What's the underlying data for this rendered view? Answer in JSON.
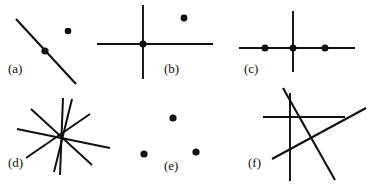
{
  "figure": {
    "width": 372,
    "height": 186,
    "background_color": "#ffffff",
    "ink_color": "#111111",
    "label_font_size": 13,
    "panels": [
      {
        "id": "a",
        "label": "(a)",
        "label_x": 8,
        "label_y": 73,
        "lines": [
          {
            "name": "diagonal-line",
            "x1": 16,
            "y1": 19,
            "x2": 76,
            "y2": 84,
            "width": 2.1
          }
        ],
        "dots": [
          {
            "name": "dot-on-line",
            "cx": 45,
            "cy": 51,
            "r": 3.6
          },
          {
            "name": "dot-off-line",
            "cx": 68,
            "cy": 31,
            "r": 3.3
          }
        ]
      },
      {
        "id": "b",
        "label": "(b)",
        "label_x": 164,
        "label_y": 73,
        "lines": [
          {
            "name": "vertical-line",
            "x1": 143,
            "y1": 5,
            "x2": 143,
            "y2": 79,
            "width": 1.9
          },
          {
            "name": "horizontal-line",
            "x1": 97,
            "y1": 44,
            "x2": 213,
            "y2": 44,
            "width": 1.9
          }
        ],
        "dots": [
          {
            "name": "dot-at-intersection",
            "cx": 143,
            "cy": 44,
            "r": 3.6
          },
          {
            "name": "dot-off-lines",
            "cx": 184,
            "cy": 18,
            "r": 3.4
          }
        ]
      },
      {
        "id": "c",
        "label": "(c)",
        "label_x": 244,
        "label_y": 73,
        "lines": [
          {
            "name": "vertical-line",
            "x1": 293,
            "y1": 11,
            "x2": 293,
            "y2": 72,
            "width": 1.9
          },
          {
            "name": "horizontal-line",
            "x1": 239,
            "y1": 48,
            "x2": 355,
            "y2": 48,
            "width": 1.9
          }
        ],
        "dots": [
          {
            "name": "dot-left-on-horizontal",
            "cx": 265,
            "cy": 48,
            "r": 3.5
          },
          {
            "name": "dot-at-intersection",
            "cx": 293,
            "cy": 48,
            "r": 3.5
          },
          {
            "name": "dot-right-on-horizontal",
            "cx": 325,
            "cy": 48,
            "r": 3.5
          }
        ]
      },
      {
        "id": "d",
        "label": "(d)",
        "label_x": 8,
        "label_y": 167,
        "lines": [
          {
            "name": "star-ray-line-1",
            "x1": 63,
            "y1": 98,
            "x2": 60,
            "y2": 175,
            "width": 2.0
          },
          {
            "name": "star-ray-line-2",
            "x1": 31,
            "y1": 109,
            "x2": 92,
            "y2": 165,
            "width": 2.0
          },
          {
            "name": "star-ray-line-3",
            "x1": 17,
            "y1": 129,
            "x2": 110,
            "y2": 148,
            "width": 2.0
          },
          {
            "name": "star-ray-line-4",
            "x1": 26,
            "y1": 158,
            "x2": 90,
            "y2": 114,
            "width": 2.0
          },
          {
            "name": "star-ray-line-5",
            "x1": 72,
            "y1": 99,
            "x2": 54,
            "y2": 172,
            "width": 2.0
          }
        ],
        "dots": []
      },
      {
        "id": "e",
        "label": "(e)",
        "label_x": 164,
        "label_y": 170,
        "lines": [],
        "dots": [
          {
            "name": "dot-top",
            "cx": 173,
            "cy": 118,
            "r": 3.6
          },
          {
            "name": "dot-bottom-left",
            "cx": 144,
            "cy": 154,
            "r": 3.6
          },
          {
            "name": "dot-bottom-right",
            "cx": 196,
            "cy": 152,
            "r": 3.6
          }
        ]
      },
      {
        "id": "f",
        "label": "(f)",
        "label_x": 248,
        "label_y": 167,
        "lines": [
          {
            "name": "vertical-line",
            "x1": 290,
            "y1": 93,
            "x2": 290,
            "y2": 181,
            "width": 1.9
          },
          {
            "name": "horizontal-line",
            "x1": 263,
            "y1": 117,
            "x2": 345,
            "y2": 117,
            "width": 1.9
          },
          {
            "name": "steep-diagonal-line",
            "x1": 283,
            "y1": 88,
            "x2": 335,
            "y2": 180,
            "width": 2.1
          },
          {
            "name": "shallow-diagonal-line",
            "x1": 272,
            "y1": 159,
            "x2": 366,
            "y2": 108,
            "width": 2.1
          }
        ],
        "dots": []
      }
    ]
  }
}
